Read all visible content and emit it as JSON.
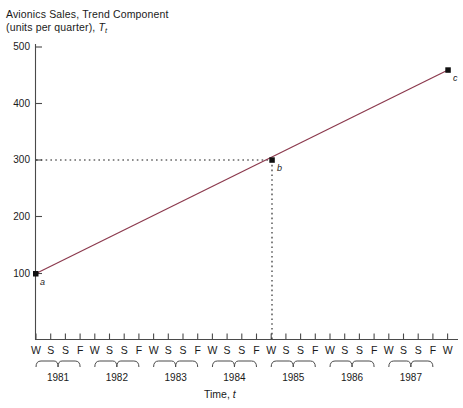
{
  "chart_data": {
    "type": "line",
    "title": "Avionics Sales, Trend Component",
    "subtitle": "(units per quarter), Tₜ",
    "title_line1": "Avionics Sales, Trend Component",
    "title_line2_prefix": "(units per quarter), ",
    "title_line2_symbol": "T",
    "title_line2_subscript": "t",
    "xlabel_prefix": "Time, ",
    "xlabel_symbol": "t",
    "ylabel": "units per quarter",
    "ylim": [
      0,
      520
    ],
    "ytick_labels": [
      "500",
      "400",
      "300",
      "200",
      "100"
    ],
    "ytick_values": [
      500,
      400,
      300,
      200,
      100
    ],
    "grid": false,
    "legend": null,
    "series": [
      {
        "name": "Trend Component",
        "color": "#8c3a4e",
        "x": [
          0,
          28
        ],
        "values": [
          100,
          440
        ]
      }
    ],
    "points": [
      {
        "label": "a",
        "x_index": 0,
        "value": 100,
        "quarter": "W",
        "year": "1981"
      },
      {
        "label": "b",
        "x_index": 16,
        "value": 300,
        "quarter": "W",
        "year": "1985"
      },
      {
        "label": "c",
        "x_index": 28,
        "value": 440,
        "quarter": "W",
        "year": "1988"
      }
    ],
    "annotations": [
      {
        "type": "dotted-horizontal",
        "from_axis": "y",
        "value": 300,
        "to_point": "b"
      },
      {
        "type": "dotted-vertical",
        "from_axis": "x",
        "x_index": 16,
        "to_point": "b"
      }
    ],
    "quarter_labels": [
      "W",
      "S",
      "S",
      "F"
    ],
    "years": [
      "1981",
      "1982",
      "1983",
      "1984",
      "1985",
      "1986",
      "1987"
    ],
    "final_tick_label": "W",
    "x_tick_count": 29,
    "axis_color": "#4a4a4a",
    "line_color": "#8c3a4e",
    "text_color": "#1a1a1a",
    "background": "#ffffff"
  }
}
